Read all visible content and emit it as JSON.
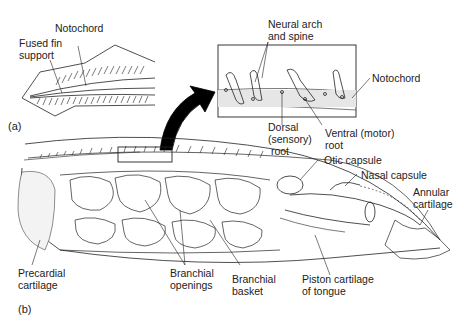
{
  "figure": {
    "panels": [
      {
        "id": "a",
        "tag": "(a)"
      },
      {
        "id": "b",
        "tag": "(b)"
      }
    ],
    "labels": {
      "notochord_a": "Notochord",
      "fused_fin_support": "Fused fin\nsupport",
      "neural_arch_spine": "Neural arch\nand spine",
      "notochord_inset": "Notochord",
      "dorsal_root": "Dorsal\n(sensory)\n root",
      "ventral_root": "Ventral (motor)\nroot",
      "otic_capsule": "Otic capsule",
      "nasal_capsule": "Nasal capsule",
      "annular_cartilage": "Annular\ncartilage",
      "precardial_cartilage": "Precardial\ncartilage",
      "branchial_openings": "Branchial\nopenings",
      "branchial_basket": "Branchial\nbasket",
      "piston_cartilage": "Piston cartilage\nof tongue"
    },
    "colors": {
      "line": "#222222",
      "arrow": "#000000",
      "stipple": "#d8d8d8"
    }
  }
}
